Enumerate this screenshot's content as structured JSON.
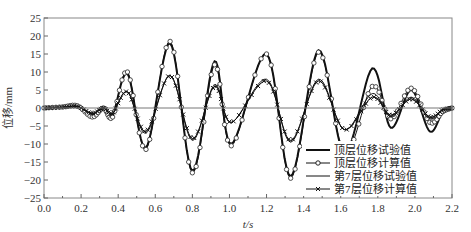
{
  "chart_data": {
    "type": "line",
    "title": "",
    "xlabel": "t/s",
    "ylabel": "位移/mm",
    "xlim": [
      0.0,
      2.2
    ],
    "ylim": [
      -25,
      25
    ],
    "xticks": [
      "0.0",
      "0.2",
      "0.4",
      "0.6",
      "0.8",
      "1.0",
      "1.2",
      "1.4",
      "1.6",
      "1.8",
      "2.0",
      "2.2"
    ],
    "yticks": [
      "25",
      "20",
      "15",
      "10",
      "5",
      "0",
      "-5",
      "-10",
      "-15",
      "-20",
      "-25"
    ],
    "grid": false,
    "legend_position": "lower right",
    "series": [
      {
        "name": "顶层位移试验值",
        "style": "thick-line",
        "x": [
          0.0,
          0.1,
          0.18,
          0.26,
          0.32,
          0.37,
          0.45,
          0.55,
          0.68,
          0.8,
          0.92,
          1.01,
          1.2,
          1.33,
          1.48,
          1.62,
          1.77,
          1.87,
          1.98,
          2.08,
          2.15,
          2.2
        ],
        "y": [
          0,
          0.3,
          0.6,
          -2,
          0,
          -2,
          9.5,
          -11,
          18,
          -17.5,
          13,
          -10,
          15,
          -19,
          16,
          -12.5,
          11,
          -5.5,
          5,
          -6.5,
          -1,
          0
        ]
      },
      {
        "name": "顶层位移计算值",
        "style": "line-circle-marker",
        "x": [
          0.0,
          0.1,
          0.18,
          0.26,
          0.32,
          0.37,
          0.45,
          0.55,
          0.68,
          0.8,
          0.92,
          1.01,
          1.2,
          1.33,
          1.48,
          1.62,
          1.77,
          1.87,
          1.98,
          2.08,
          2.15,
          2.2
        ],
        "y": [
          0,
          0.3,
          0.6,
          -2.5,
          0,
          -2.5,
          10,
          -11.5,
          18.5,
          -18,
          12,
          -10.5,
          15,
          -19.5,
          15.5,
          -12.5,
          6,
          -3,
          5.5,
          -4,
          -1,
          0
        ]
      },
      {
        "name": "第7层位移试验值",
        "style": "thin-line",
        "x": [
          0.0,
          0.1,
          0.18,
          0.26,
          0.32,
          0.37,
          0.45,
          0.55,
          0.68,
          0.8,
          0.92,
          1.01,
          1.2,
          1.33,
          1.48,
          1.62,
          1.77,
          1.87,
          1.98,
          2.08,
          2.15,
          2.2
        ],
        "y": [
          0,
          0.2,
          0.4,
          -1.5,
          0,
          -1.5,
          4.5,
          -7,
          9,
          -9,
          6.5,
          -4,
          8,
          -9.5,
          8,
          -6,
          4,
          -2.5,
          3,
          -3,
          -0.5,
          0
        ]
      },
      {
        "name": "第7层位移计算值",
        "style": "line-star-marker",
        "x": [
          0.0,
          0.1,
          0.18,
          0.26,
          0.32,
          0.37,
          0.45,
          0.55,
          0.68,
          0.8,
          0.92,
          1.01,
          1.2,
          1.33,
          1.48,
          1.62,
          1.77,
          1.87,
          1.98,
          2.08,
          2.15,
          2.2
        ],
        "y": [
          0,
          0.2,
          0.4,
          -1.5,
          0,
          -1.5,
          4.5,
          -6.5,
          9,
          -8.5,
          6,
          -4,
          7.5,
          -9,
          7.5,
          -6,
          3,
          -2,
          2.5,
          -2.5,
          -0.5,
          0
        ]
      }
    ]
  }
}
